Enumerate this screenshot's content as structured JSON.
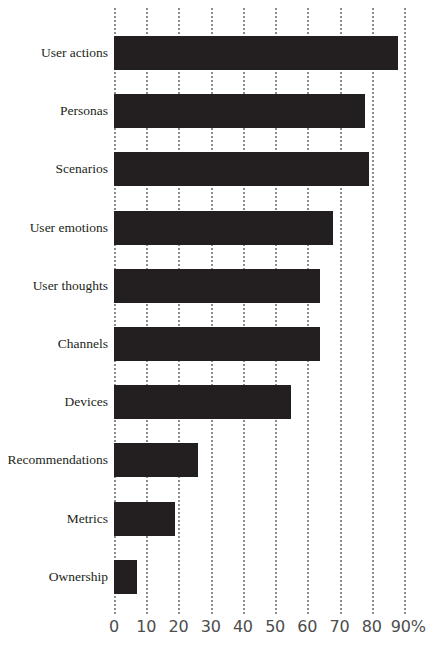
{
  "chart_data": {
    "type": "bar",
    "orientation": "horizontal",
    "title": "",
    "subtitle": "",
    "xlabel": "",
    "ylabel": "",
    "categories": [
      "User actions",
      "Personas",
      "Scenarios",
      "User emotions",
      "User thoughts",
      "Channels",
      "Devices",
      "Recommendations",
      "Metrics",
      "Ownership"
    ],
    "values": [
      88,
      78,
      79,
      68,
      64,
      64,
      55,
      26,
      19,
      7
    ],
    "series": [
      {
        "name": "Percentage of journey maps containing element",
        "values": [
          88,
          78,
          79,
          68,
          64,
          64,
          55,
          26,
          19,
          7
        ]
      }
    ],
    "xlim": [
      0,
      90
    ],
    "xticks": [
      0,
      10,
      20,
      30,
      40,
      50,
      60,
      70,
      80,
      90
    ],
    "xtick_labels": [
      "0",
      "10",
      "20",
      "30",
      "40",
      "50",
      "60",
      "70",
      "80",
      "90%"
    ],
    "unit": "%",
    "grid": "vertical-dotted",
    "legend": "none",
    "bar_color": "#231f20",
    "gridline_color": "#8c8c8c",
    "background_color": "#ffffff",
    "tick_label_color": "#4d4d4d",
    "category_label_color": "#231f20"
  }
}
